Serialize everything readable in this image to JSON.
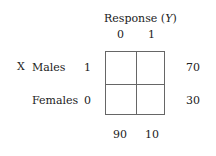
{
  "diagram": {
    "column_header": "Response (Y)",
    "column_header_parts": {
      "prefix": "Response (",
      "var": "Y",
      "suffix": ")"
    },
    "column_values": [
      "0",
      "1"
    ],
    "row_variable": "X",
    "rows": [
      {
        "label": "Males",
        "value": "1",
        "total": "70"
      },
      {
        "label": "Females",
        "value": "0",
        "total": "30"
      }
    ],
    "column_totals": [
      "90",
      "10"
    ],
    "cells": [
      [
        "",
        ""
      ],
      [
        "",
        ""
      ]
    ]
  }
}
